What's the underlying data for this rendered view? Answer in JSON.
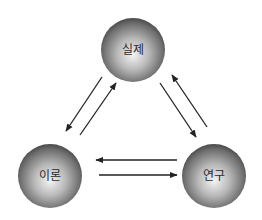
{
  "diagram": {
    "type": "cycle-triangle",
    "nodes": [
      {
        "id": "reality",
        "label": "실제",
        "cx": 133,
        "cy": 50,
        "r": 32
      },
      {
        "id": "theory",
        "label": "이론",
        "cx": 50,
        "cy": 176,
        "r": 32
      },
      {
        "id": "research",
        "label": "연구",
        "cx": 214,
        "cy": 176,
        "r": 32
      }
    ],
    "edges": [
      {
        "from": "reality",
        "to": "theory"
      },
      {
        "from": "theory",
        "to": "reality"
      },
      {
        "from": "reality",
        "to": "research"
      },
      {
        "from": "research",
        "to": "reality"
      },
      {
        "from": "research",
        "to": "theory"
      },
      {
        "from": "theory",
        "to": "research"
      }
    ],
    "colors": {
      "sphere_light": "#f2f2f2",
      "sphere_mid": "#9a9a9a",
      "sphere_dark": "#4a4a4a",
      "arrow": "#222222",
      "label": "#2a2a2a"
    }
  }
}
